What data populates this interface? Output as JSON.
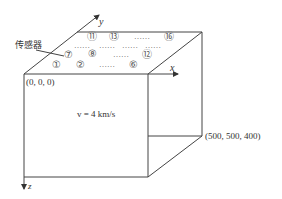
{
  "diagram": {
    "label_sensor": "传感器",
    "origin_label": "(0, 0, 0)",
    "far_corner_label": "(500, 500, 400)",
    "velocity_label": "v = 4 km/s",
    "axes": {
      "x": "x",
      "y": "y",
      "z": "z"
    },
    "sensors": {
      "row_front": [
        "①",
        "②",
        "⑥"
      ],
      "row_middle": [
        "⑦",
        "⑧",
        "⑫"
      ],
      "row_back": [
        "⑪",
        "⑬",
        "⑯"
      ],
      "ellipsis": "……"
    },
    "colors": {
      "line": "#444444",
      "text": "#333333",
      "background": "#ffffff"
    }
  }
}
